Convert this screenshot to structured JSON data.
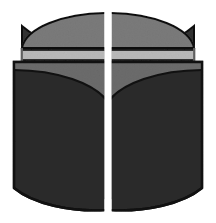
{
  "figure": {
    "title": "Split cylinder technical illustration",
    "canvas": {
      "width": 216,
      "height": 223,
      "background_color": "#ffffff"
    },
    "palette": {
      "background": "#ffffff",
      "top_face_gray": "#7b7b7b",
      "top_face_gray_light": "#8a8a8a",
      "band_light_gray": "#b9b9b9",
      "panel_upper_gray": "#6f6f6f",
      "body_dark": "#2b2b2b",
      "body_dark_alt": "#262626",
      "rear_body_dark": "#313131",
      "outline_black": "#111111",
      "edge_gray": "#9a9a9a"
    },
    "geometry": {
      "center_split_x": 108,
      "center_gap_width": 7,
      "top_ellipse_apex_y": 13,
      "band_top_y": 50,
      "band_bottom_y": 60,
      "front_panel_top_y": 62,
      "bottom_apex_y": 210,
      "left_outer_x": 14,
      "right_outer_x": 202
    },
    "parts": [
      {
        "id": "left-top-face",
        "label": "Left top elliptical face",
        "fill": "#7b7b7b"
      },
      {
        "id": "right-top-face",
        "label": "Right top elliptical face",
        "fill": "#7b7b7b"
      },
      {
        "id": "left-band",
        "label": "Left light horizontal band",
        "fill": "#b9b9b9"
      },
      {
        "id": "right-band",
        "label": "Right light horizontal band",
        "fill": "#b9b9b9"
      },
      {
        "id": "left-rear-body",
        "label": "Left rear cylinder body",
        "fill": "#313131"
      },
      {
        "id": "right-rear-body",
        "label": "Right rear cylinder body",
        "fill": "#313131"
      },
      {
        "id": "left-front-panel",
        "label": "Left front panel",
        "fill": "#2b2b2b"
      },
      {
        "id": "right-front-panel",
        "label": "Right front panel",
        "fill": "#2b2b2b"
      }
    ]
  }
}
